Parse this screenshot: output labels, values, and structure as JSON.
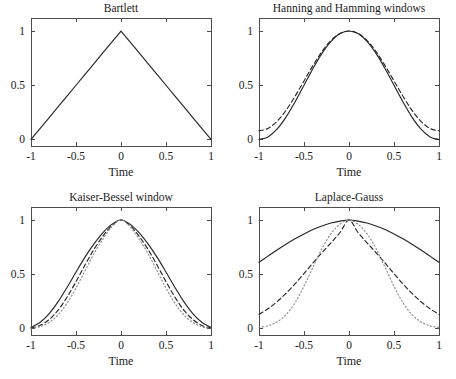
{
  "figure": {
    "width": 456,
    "height": 379,
    "background": "#ffffff",
    "ink_color": "#262626",
    "axis_color": "#4d4d4d",
    "faint_color": "#8c8c8c"
  },
  "common": {
    "xlabel": "Time",
    "xticks": [
      "-1",
      "-0.5",
      "0",
      "0.5",
      "1"
    ],
    "xtick_values": [
      -1,
      -0.5,
      0,
      0.5,
      1
    ],
    "yticks": [
      "0",
      "0.5",
      "1"
    ],
    "ytick_values": [
      0,
      0.5,
      1
    ],
    "xlim": [
      -1,
      1
    ],
    "ylim": [
      -0.06,
      1.12
    ],
    "grid": false,
    "legend": "none"
  },
  "chart_data": [
    {
      "id": "bartlett",
      "type": "line",
      "title": "Bartlett",
      "xlabel": "Time",
      "ylabel": "",
      "xlim": [
        -1,
        1
      ],
      "ylim": [
        -0.06,
        1.12
      ],
      "xticks": [
        -1,
        -0.5,
        0,
        0.5,
        1
      ],
      "xtick_labels": [
        "-1",
        "-0.5",
        "0",
        "0.5",
        "1"
      ],
      "yticks": [
        0,
        0.5,
        1
      ],
      "ytick_labels": [
        "0",
        "0.5",
        "1"
      ],
      "grid": false,
      "legend": "none",
      "series": [
        {
          "name": "Bartlett (triangular) window",
          "style": "solid",
          "x": [
            -1,
            -0.9,
            -0.8,
            -0.7,
            -0.6,
            -0.5,
            -0.4,
            -0.3,
            -0.2,
            -0.1,
            0,
            0.1,
            0.2,
            0.3,
            0.4,
            0.5,
            0.6,
            0.7,
            0.8,
            0.9,
            1
          ],
          "values": [
            0,
            0.1,
            0.2,
            0.3,
            0.4,
            0.5,
            0.6,
            0.7,
            0.8,
            0.9,
            1,
            0.9,
            0.8,
            0.7,
            0.6,
            0.5,
            0.4,
            0.3,
            0.2,
            0.1,
            0
          ]
        }
      ]
    },
    {
      "id": "hanning-hamming",
      "type": "line",
      "title": "Hanning and Hamming windows",
      "xlabel": "Time",
      "ylabel": "",
      "xlim": [
        -1,
        1
      ],
      "ylim": [
        -0.06,
        1.12
      ],
      "xticks": [
        -1,
        -0.5,
        0,
        0.5,
        1
      ],
      "xtick_labels": [
        "-1",
        "-0.5",
        "0",
        "0.5",
        "1"
      ],
      "yticks": [
        0,
        0.5,
        1
      ],
      "ytick_labels": [
        "0",
        "0.5",
        "1"
      ],
      "grid": false,
      "legend": "none",
      "series": [
        {
          "name": "Hanning",
          "style": "solid",
          "x": [
            -1,
            -0.9,
            -0.8,
            -0.7,
            -0.6,
            -0.5,
            -0.4,
            -0.3,
            -0.2,
            -0.1,
            0,
            0.1,
            0.2,
            0.3,
            0.4,
            0.5,
            0.6,
            0.7,
            0.8,
            0.9,
            1
          ],
          "values": [
            0,
            0.024,
            0.095,
            0.206,
            0.345,
            0.5,
            0.655,
            0.794,
            0.905,
            0.976,
            1,
            0.976,
            0.905,
            0.794,
            0.655,
            0.5,
            0.345,
            0.206,
            0.095,
            0.024,
            0
          ]
        },
        {
          "name": "Hamming",
          "style": "dashed",
          "x": [
            -1,
            -0.9,
            -0.8,
            -0.7,
            -0.6,
            -0.5,
            -0.4,
            -0.3,
            -0.2,
            -0.1,
            0,
            0.1,
            0.2,
            0.3,
            0.4,
            0.5,
            0.6,
            0.7,
            0.8,
            0.9,
            1
          ],
          "values": [
            0.08,
            0.102,
            0.167,
            0.269,
            0.398,
            0.54,
            0.682,
            0.811,
            0.913,
            0.978,
            1,
            0.978,
            0.913,
            0.811,
            0.682,
            0.54,
            0.398,
            0.269,
            0.167,
            0.102,
            0.08
          ]
        }
      ]
    },
    {
      "id": "kaiser-bessel",
      "type": "line",
      "title": "Kaiser-Bessel window",
      "xlabel": "Time",
      "ylabel": "",
      "xlim": [
        -1,
        1
      ],
      "ylim": [
        -0.06,
        1.12
      ],
      "xticks": [
        -1,
        -0.5,
        0,
        0.5,
        1
      ],
      "xtick_labels": [
        "-1",
        "-0.5",
        "0",
        "0.5",
        "1"
      ],
      "yticks": [
        0,
        0.5,
        1
      ],
      "ytick_labels": [
        "0",
        "0.5",
        "1"
      ],
      "grid": false,
      "legend": "none",
      "series": [
        {
          "name": "Kaiser-Bessel, small alpha",
          "style": "solid",
          "x": [
            -1,
            -0.9,
            -0.8,
            -0.7,
            -0.6,
            -0.5,
            -0.4,
            -0.3,
            -0.2,
            -0.1,
            0,
            0.1,
            0.2,
            0.3,
            0.4,
            0.5,
            0.6,
            0.7,
            0.8,
            0.9,
            1
          ],
          "values": [
            0.01,
            0.055,
            0.135,
            0.245,
            0.378,
            0.52,
            0.658,
            0.78,
            0.884,
            0.962,
            1,
            0.962,
            0.884,
            0.78,
            0.658,
            0.52,
            0.378,
            0.245,
            0.135,
            0.055,
            0.01
          ]
        },
        {
          "name": "Kaiser-Bessel, medium alpha",
          "style": "dashed",
          "x": [
            -1,
            -0.9,
            -0.8,
            -0.7,
            -0.6,
            -0.5,
            -0.4,
            -0.3,
            -0.2,
            -0.1,
            0,
            0.1,
            0.2,
            0.3,
            0.4,
            0.5,
            0.6,
            0.7,
            0.8,
            0.9,
            1
          ],
          "values": [
            0.004,
            0.028,
            0.082,
            0.168,
            0.288,
            0.432,
            0.585,
            0.73,
            0.852,
            0.95,
            1,
            0.95,
            0.852,
            0.73,
            0.585,
            0.432,
            0.288,
            0.168,
            0.082,
            0.028,
            0.004
          ]
        },
        {
          "name": "Kaiser-Bessel, large alpha",
          "style": "dotted",
          "x": [
            -1,
            -0.9,
            -0.8,
            -0.7,
            -0.6,
            -0.5,
            -0.4,
            -0.3,
            -0.2,
            -0.1,
            0,
            0.1,
            0.2,
            0.3,
            0.4,
            0.5,
            0.6,
            0.7,
            0.8,
            0.9,
            1
          ],
          "values": [
            0.002,
            0.016,
            0.055,
            0.125,
            0.232,
            0.373,
            0.532,
            0.69,
            0.825,
            0.94,
            1,
            0.94,
            0.825,
            0.69,
            0.532,
            0.373,
            0.232,
            0.125,
            0.055,
            0.016,
            0.002
          ]
        }
      ]
    },
    {
      "id": "laplace-gauss",
      "type": "line",
      "title": "Laplace-Gauss",
      "xlabel": "Time",
      "ylabel": "",
      "xlim": [
        -1,
        1
      ],
      "ylim": [
        -0.06,
        1.12
      ],
      "xticks": [
        -1,
        -0.5,
        0,
        0.5,
        1
      ],
      "xtick_labels": [
        "-1",
        "-0.5",
        "0",
        "0.5",
        "1"
      ],
      "yticks": [
        0,
        0.5,
        1
      ],
      "ytick_labels": [
        "0",
        "0.5",
        "1"
      ],
      "grid": false,
      "legend": "none",
      "series": [
        {
          "name": "Gaussian, wide sigma",
          "style": "solid",
          "x": [
            -1,
            -0.9,
            -0.8,
            -0.7,
            -0.6,
            -0.5,
            -0.4,
            -0.3,
            -0.2,
            -0.1,
            0,
            0.1,
            0.2,
            0.3,
            0.4,
            0.5,
            0.6,
            0.7,
            0.8,
            0.9,
            1
          ],
          "values": [
            0.61,
            0.667,
            0.723,
            0.777,
            0.827,
            0.872,
            0.912,
            0.945,
            0.972,
            0.99,
            1,
            0.99,
            0.972,
            0.945,
            0.912,
            0.872,
            0.827,
            0.777,
            0.723,
            0.667,
            0.61
          ]
        },
        {
          "name": "Gaussian, medium sigma",
          "style": "dashed",
          "x": [
            -1,
            -0.9,
            -0.8,
            -0.7,
            -0.6,
            -0.5,
            -0.4,
            -0.3,
            -0.2,
            -0.1,
            0,
            0.1,
            0.2,
            0.3,
            0.4,
            0.5,
            0.6,
            0.7,
            0.8,
            0.9,
            1
          ],
          "values": [
            0.13,
            0.182,
            0.247,
            0.324,
            0.411,
            0.506,
            0.604,
            0.7,
            0.79,
            0.885,
            1,
            0.885,
            0.79,
            0.7,
            0.604,
            0.506,
            0.411,
            0.324,
            0.247,
            0.182,
            0.13
          ]
        },
        {
          "name": "Gaussian, narrow sigma",
          "style": "dotted",
          "x": [
            -1,
            -0.9,
            -0.8,
            -0.7,
            -0.6,
            -0.5,
            -0.4,
            -0.3,
            -0.2,
            -0.1,
            0,
            0.1,
            0.2,
            0.3,
            0.4,
            0.5,
            0.6,
            0.7,
            0.8,
            0.9,
            1
          ],
          "values": [
            0.01,
            0.025,
            0.06,
            0.128,
            0.237,
            0.39,
            0.566,
            0.738,
            0.874,
            0.962,
            1,
            0.962,
            0.874,
            0.738,
            0.566,
            0.39,
            0.237,
            0.128,
            0.06,
            0.025,
            0.01
          ]
        }
      ]
    }
  ],
  "panels": [
    {
      "id": "bartlett",
      "x": 0,
      "y": 0,
      "w": 228,
      "h": 190
    },
    {
      "id": "hanning-hamming",
      "x": 228,
      "y": 0,
      "w": 228,
      "h": 190
    },
    {
      "id": "kaiser-bessel",
      "x": 0,
      "y": 189,
      "w": 228,
      "h": 190
    },
    {
      "id": "laplace-gauss",
      "x": 228,
      "y": 189,
      "w": 228,
      "h": 190
    }
  ]
}
